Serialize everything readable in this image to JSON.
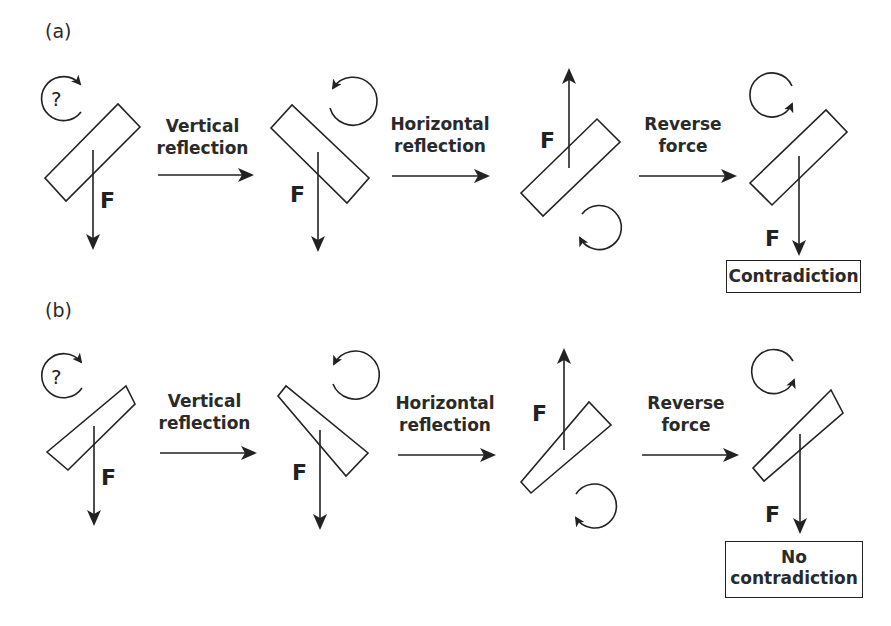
{
  "panels": {
    "a": {
      "label": "(a)",
      "steps": [
        {
          "transform_label_line1": "Vertical",
          "transform_label_line2": "reflection"
        },
        {
          "transform_label_line1": "Horizontal",
          "transform_label_line2": "reflection"
        },
        {
          "transform_label_line1": "Reverse",
          "transform_label_line2": "force"
        }
      ],
      "force_label": "F",
      "unknown_rotation_symbol": "?",
      "object_shape": "rectangle",
      "result": "Contradiction"
    },
    "b": {
      "label": "(b)",
      "steps": [
        {
          "transform_label_line1": "Vertical",
          "transform_label_line2": "reflection"
        },
        {
          "transform_label_line1": "Horizontal",
          "transform_label_line2": "reflection"
        },
        {
          "transform_label_line1": "Reverse",
          "transform_label_line2": "force"
        }
      ],
      "force_label": "F",
      "unknown_rotation_symbol": "?",
      "object_shape": "tapered bar",
      "result_line1": "No",
      "result_line2": "contradiction"
    }
  },
  "colors": {
    "stroke": "#222222",
    "text": "#2a2a2a",
    "background": "#ffffff"
  }
}
